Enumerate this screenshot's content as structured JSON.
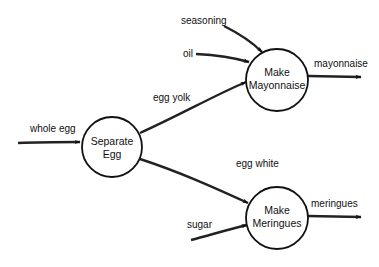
{
  "diagram": {
    "type": "data-flow-diagram",
    "nodes": [
      {
        "id": "separate",
        "line1": "Separate",
        "line2": "Egg",
        "cx": 112,
        "cy": 147,
        "r": 30
      },
      {
        "id": "mayo",
        "line1": "Make",
        "line2": "Mayonnaise",
        "cx": 277,
        "cy": 80,
        "r": 31
      },
      {
        "id": "meringue",
        "line1": "Make",
        "line2": "Meringues",
        "cx": 277,
        "cy": 218,
        "r": 31
      }
    ],
    "flows": [
      {
        "id": "whole_egg",
        "label": "whole egg",
        "from": "external",
        "to": "separate"
      },
      {
        "id": "egg_yolk",
        "label": "egg yolk",
        "from": "separate",
        "to": "mayo"
      },
      {
        "id": "egg_white",
        "label": "egg white",
        "from": "separate",
        "to": "meringue"
      },
      {
        "id": "seasoning",
        "label": "seasoning",
        "from": "external",
        "to": "mayo"
      },
      {
        "id": "oil",
        "label": "oil",
        "from": "external",
        "to": "mayo"
      },
      {
        "id": "mayonnaise",
        "label": "mayonnaise",
        "from": "mayo",
        "to": "external"
      },
      {
        "id": "sugar",
        "label": "sugar",
        "from": "external",
        "to": "meringue"
      },
      {
        "id": "meringues",
        "label": "meringues",
        "from": "meringue",
        "to": "external"
      }
    ]
  }
}
